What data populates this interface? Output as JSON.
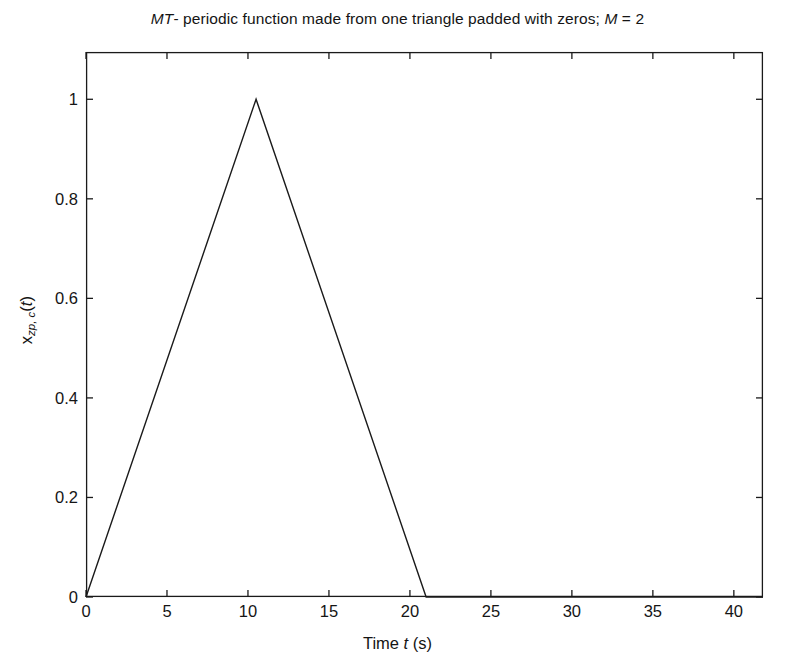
{
  "chart_data": {
    "type": "line",
    "title": "MT- periodic function made from one triangle padded with zeros; M = 2",
    "title_parts": {
      "italic_lead": "MT",
      "main": "- periodic function made from one triangle padded with zeros; ",
      "italic_symbol": "M",
      "tail": " = 2"
    },
    "xlabel": "Time t (s)",
    "xlabel_parts": {
      "lead": "Time ",
      "italic_symbol": "t",
      "tail": " (s)"
    },
    "ylabel": "x_zp,c(t)",
    "ylabel_parts": {
      "base": "x",
      "subscript": "zp, c",
      "italic_arg": "t"
    },
    "xlim": [
      0,
      41.8
    ],
    "ylim": [
      0,
      1.095
    ],
    "xticks": [
      0,
      5,
      10,
      15,
      20,
      25,
      30,
      35,
      40
    ],
    "xtick_labels": [
      "0",
      "5",
      "10",
      "15",
      "20",
      "25",
      "30",
      "35",
      "40"
    ],
    "yticks": [
      0,
      0.2,
      0.4,
      0.6,
      0.8,
      1
    ],
    "ytick_labels": [
      "0",
      "0.2",
      "0.4",
      "0.6",
      "0.8",
      "1"
    ],
    "grid": false,
    "legend": false,
    "series": [
      {
        "name": "x_zp,c(t)",
        "color": "#1a1a1a",
        "line_width": 1.4,
        "x": [
          0,
          10.5,
          21,
          41.8
        ],
        "y": [
          0,
          1,
          0,
          0
        ]
      }
    ],
    "annotations": {
      "triangle_base_start": 0,
      "triangle_peak_t": 10.5,
      "triangle_peak_value": 1,
      "triangle_base_end": 21,
      "zero_padding_from": 21,
      "zero_padding_to": 41.8,
      "period_MT": 42,
      "M": 2,
      "T": 21
    }
  },
  "figure": {
    "background": "#ffffff",
    "axis_color": "#1a1a1a",
    "text_color": "#141414"
  }
}
